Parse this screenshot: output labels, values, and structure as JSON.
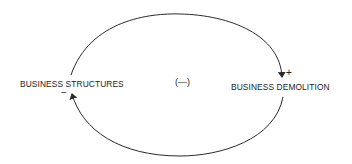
{
  "diagram": {
    "type": "causal-loop",
    "nodes": [
      {
        "id": "business_structures",
        "label": "BUSINESS STRUCTURES"
      },
      {
        "id": "business_demolition",
        "label": "BUSINESS DEMOLITION"
      }
    ],
    "links": [
      {
        "from": "business_structures",
        "to": "business_demolition",
        "polarity": "+",
        "path": "upper-arc"
      },
      {
        "from": "business_demolition",
        "to": "business_structures",
        "polarity": "−",
        "path": "lower-arc"
      }
    ],
    "loop_polarity": "(—)",
    "colors": {
      "line": "#2a2a2a",
      "text": "#1c1c1c",
      "background": "#ffffff"
    }
  }
}
